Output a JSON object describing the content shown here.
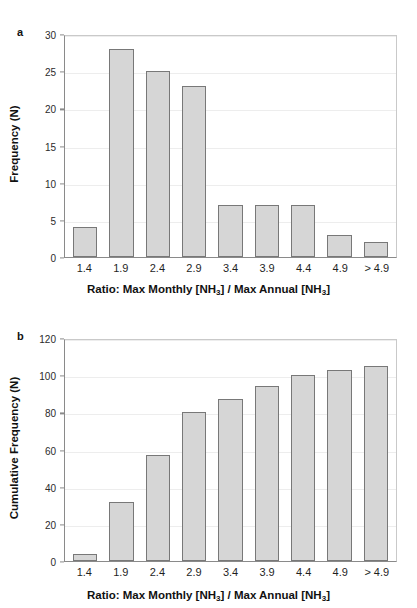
{
  "figure": {
    "background": "#ffffff",
    "bar_fill": "#d6d6d6",
    "bar_border": "#787878",
    "grid_color": "#ededed",
    "axis_color": "#8a8a8a"
  },
  "panels": [
    {
      "tag": "a",
      "ylabel": "Frequency (N)",
      "xlabel_parts": {
        "pre": "Ratio: Max Monthly [NH",
        "sub1": "3",
        "mid": "] / Max Annual [NH",
        "sub2": "3",
        "post": "]"
      },
      "yticks": [
        "0",
        "5",
        "10",
        "15",
        "20",
        "25",
        "30"
      ]
    },
    {
      "tag": "b",
      "ylabel": "Cumulative Frequency (N)",
      "xlabel_parts": {
        "pre": "Ratio: Max Monthly [NH",
        "sub1": "3",
        "mid": "] / Max Annual [NH",
        "sub2": "3",
        "post": "]"
      },
      "yticks": [
        "0",
        "20",
        "40",
        "60",
        "80",
        "100",
        "120"
      ]
    }
  ],
  "chart_data": [
    {
      "type": "bar",
      "panel": "a",
      "title": "",
      "xlabel": "Ratio: Max Monthly [NH3] / Max Annual [NH3]",
      "ylabel": "Frequency (N)",
      "categories": [
        "1.4",
        "1.9",
        "2.4",
        "2.9",
        "3.4",
        "3.9",
        "4.4",
        "4.9",
        "> 4.9"
      ],
      "values": [
        4,
        28,
        25,
        23,
        7,
        7,
        7,
        3,
        2
      ],
      "ylim": [
        0,
        30
      ],
      "ytick_step": 5,
      "grid": true,
      "legend": "none"
    },
    {
      "type": "bar",
      "panel": "b",
      "title": "",
      "xlabel": "Ratio: Max Monthly [NH3] / Max Annual [NH3]",
      "ylabel": "Cumulative Frequency (N)",
      "categories": [
        "1.4",
        "1.9",
        "2.4",
        "2.9",
        "3.4",
        "3.9",
        "4.4",
        "4.9",
        "> 4.9"
      ],
      "values": [
        4,
        32,
        57,
        80,
        87,
        94,
        100,
        103,
        105
      ],
      "ylim": [
        0,
        120
      ],
      "ytick_step": 20,
      "grid": true,
      "legend": "none"
    }
  ]
}
